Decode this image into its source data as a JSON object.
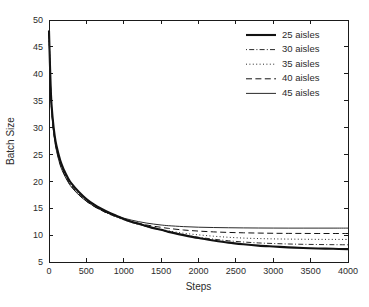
{
  "chart_data": {
    "type": "line",
    "title": "",
    "xlabel": "Steps",
    "ylabel": "Batch Size",
    "xlim": [
      0,
      4000
    ],
    "ylim": [
      5,
      50
    ],
    "xticks": [
      0,
      500,
      1000,
      1500,
      2000,
      2500,
      3000,
      3500,
      4000
    ],
    "yticks": [
      5,
      10,
      15,
      20,
      25,
      30,
      35,
      40,
      45,
      50
    ],
    "xtick_labels": [
      "0",
      "500",
      "1000",
      "1500",
      "2000",
      "2500",
      "3000",
      "3500",
      "4000"
    ],
    "ytick_labels": [
      "5",
      "10",
      "15",
      "20",
      "25",
      "30",
      "35",
      "40",
      "45",
      "50"
    ],
    "grid": false,
    "legend_position": "top-right",
    "legend_frame": false,
    "line_color": "#121212",
    "background": "#ffffff",
    "x": [
      0,
      25,
      50,
      75,
      100,
      150,
      200,
      250,
      300,
      400,
      500,
      600,
      700,
      800,
      900,
      1000,
      1100,
      1200,
      1300,
      1400,
      1500,
      1600,
      1800,
      2000,
      2200,
      2400,
      2600,
      2800,
      3000,
      3200,
      3400,
      3600,
      3800,
      4000
    ],
    "series": [
      {
        "name": "25 aisles",
        "label": "25 aisles",
        "style": "solid",
        "width": 2.1,
        "dasharray": "",
        "final_value": 7.4,
        "values": [
          48.0,
          36.5,
          31.6,
          28.6,
          26.6,
          23.9,
          22.1,
          20.7,
          19.6,
          18.0,
          16.7,
          15.7,
          14.9,
          14.2,
          13.6,
          13.0,
          12.5,
          12.1,
          11.7,
          11.3,
          11.0,
          10.6,
          10.0,
          9.45,
          9.0,
          8.6,
          8.3,
          8.05,
          7.88,
          7.72,
          7.6,
          7.52,
          7.45,
          7.4
        ]
      },
      {
        "name": "30 aisles",
        "label": "30 aisles",
        "style": "dashdot",
        "width": 0.9,
        "dasharray": "1,2.2,5,2.2",
        "final_value": 8.2,
        "values": [
          48.0,
          36.3,
          31.3,
          28.3,
          26.3,
          23.6,
          21.8,
          20.4,
          19.3,
          17.7,
          16.5,
          15.5,
          14.7,
          14.0,
          13.45,
          12.9,
          12.4,
          12.0,
          11.6,
          11.25,
          10.95,
          10.6,
          10.05,
          9.6,
          9.25,
          8.95,
          8.72,
          8.55,
          8.44,
          8.35,
          8.29,
          8.25,
          8.22,
          8.2
        ]
      },
      {
        "name": "35 aisles",
        "label": "35 aisles",
        "style": "dotted",
        "width": 0.9,
        "dasharray": "1,2.4",
        "final_value": 9.2,
        "values": [
          48.0,
          36.1,
          31.1,
          28.1,
          26.1,
          23.4,
          21.6,
          20.2,
          19.15,
          17.6,
          16.35,
          15.4,
          14.6,
          13.95,
          13.35,
          12.85,
          12.4,
          12.0,
          11.65,
          11.3,
          11.05,
          10.8,
          10.35,
          10.05,
          9.8,
          9.6,
          9.45,
          9.36,
          9.3,
          9.26,
          9.23,
          9.21,
          9.2,
          9.2
        ]
      },
      {
        "name": "40 aisles",
        "label": "40 aisles",
        "style": "dashed",
        "width": 1.0,
        "dasharray": "6,3.4",
        "final_value": 10.3,
        "values": [
          48.0,
          35.9,
          30.9,
          27.9,
          25.9,
          23.2,
          21.45,
          20.1,
          19.05,
          17.5,
          16.3,
          15.35,
          14.6,
          13.95,
          13.4,
          12.95,
          12.55,
          12.2,
          11.9,
          11.65,
          11.45,
          11.25,
          10.95,
          10.75,
          10.6,
          10.5,
          10.43,
          10.38,
          10.34,
          10.32,
          10.31,
          10.3,
          10.3,
          10.3
        ]
      },
      {
        "name": "45 aisles",
        "label": "45 aisles",
        "style": "solid",
        "width": 0.9,
        "dasharray": "",
        "final_value": 11.3,
        "values": [
          48.0,
          35.7,
          30.7,
          27.7,
          25.7,
          23.0,
          21.3,
          20.0,
          18.95,
          17.45,
          16.3,
          15.4,
          14.65,
          14.05,
          13.55,
          13.15,
          12.8,
          12.5,
          12.25,
          12.05,
          11.88,
          11.75,
          11.58,
          11.47,
          11.41,
          11.37,
          11.34,
          11.32,
          11.31,
          11.3,
          11.3,
          11.3,
          11.3,
          11.3
        ]
      }
    ]
  }
}
